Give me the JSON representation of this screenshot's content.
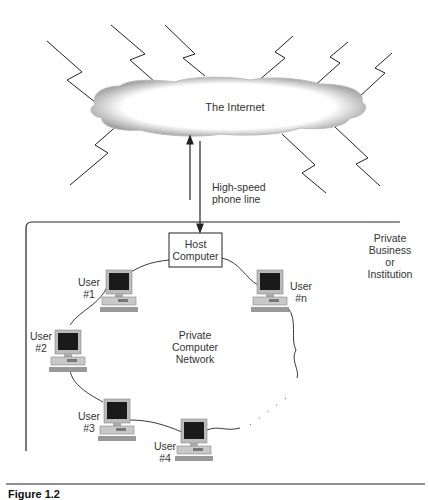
{
  "cloud": {
    "label": "The Internet"
  },
  "link": {
    "label_line1": "High-speed",
    "label_line2": "phone line"
  },
  "host": {
    "label_line1": "Host",
    "label_line2": "Computer"
  },
  "boundary": {
    "label_line1": "Private",
    "label_line2": "Business",
    "label_line3": "or",
    "label_line4": "Institution"
  },
  "network": {
    "label_line1": "Private",
    "label_line2": "Computer",
    "label_line3": "Network"
  },
  "users": [
    {
      "line1": "User",
      "line2": "#1"
    },
    {
      "line1": "User",
      "line2": "#2"
    },
    {
      "line1": "User",
      "line2": "#3"
    },
    {
      "line1": "User",
      "line2": "#4"
    },
    {
      "line1": "User",
      "line2": "#n"
    }
  ],
  "caption": "Figure 1.2"
}
